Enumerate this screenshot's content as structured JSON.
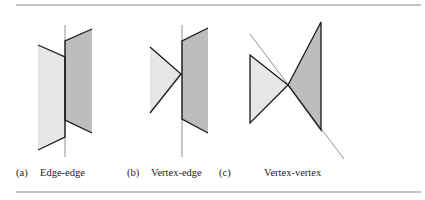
{
  "figure": {
    "subfigures": [
      {
        "tag": "(a)",
        "caption": "Edge-edge"
      },
      {
        "tag": "(b)",
        "caption": "Vertex-edge"
      },
      {
        "tag": "(c)",
        "caption": "Vertex-vertex"
      }
    ]
  },
  "colors": {
    "light_fill": "#e6e6e6",
    "dark_fill": "#bdbdbd",
    "edge": "#1a1a1a",
    "separator": "#777777",
    "rule": "#8a8a8a"
  }
}
